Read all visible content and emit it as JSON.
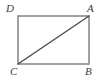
{
  "figure": {
    "kind": "geometry-diagram",
    "background_color": "#ffffff",
    "canvas": {
      "width": 106,
      "height": 82
    },
    "rectangle": {
      "name": "rectangle-ABCD",
      "stroke_color": "#8a8a8a",
      "stroke_width": 1.6,
      "fill": "none",
      "x": 18,
      "y": 16,
      "width": 71,
      "height": 48
    },
    "diagonal": {
      "name": "diagonal-CA",
      "from": "C",
      "to": "A",
      "stroke_color": "#4a4a4a",
      "stroke_width": 1.4,
      "x1": 18,
      "y1": 64,
      "x2": 89,
      "y2": 16
    },
    "vertices": [
      {
        "id": "D",
        "label": "D",
        "position": "top-left",
        "x": 18,
        "y": 16
      },
      {
        "id": "A",
        "label": "A",
        "position": "top-right",
        "x": 89,
        "y": 16
      },
      {
        "id": "C",
        "label": "C",
        "position": "bottom-left",
        "x": 18,
        "y": 64
      },
      {
        "id": "B",
        "label": "B",
        "position": "bottom-right",
        "x": 89,
        "y": 64
      }
    ],
    "label_color": "#3d3d3d"
  }
}
